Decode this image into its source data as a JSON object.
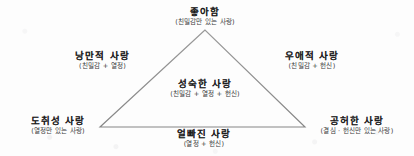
{
  "diagram": {
    "kind": "triangle-diagram",
    "background_color": "#fdfdfd",
    "line_color": "#8d8d8d",
    "text_color": "#1d1d1d",
    "triangle": {
      "apex": {
        "x": 205,
        "y": 30
      },
      "bottom_left": {
        "x": 100,
        "y": 127
      },
      "bottom_right": {
        "x": 305,
        "y": 127
      }
    },
    "nodes": {
      "liking": {
        "title": "좋아함",
        "subtitle": "(친밀감만 있는 사랑)",
        "position": "top-vertex"
      },
      "romantic": {
        "title": "낭만적 사랑",
        "subtitle": "(친밀감 + 열정)",
        "position": "left-edge"
      },
      "companionate": {
        "title": "우애적 사랑",
        "subtitle": "(친밀감 + 헌신)",
        "position": "right-edge"
      },
      "consummate": {
        "title": "성숙한 사랑",
        "subtitle": "(친밀감 + 열정 + 헌신)",
        "position": "center"
      },
      "infatuation": {
        "title": "도취성 사랑",
        "subtitle": "(열정만 있는 사랑)",
        "position": "bottom-left-vertex"
      },
      "empty": {
        "title": "공허한 사랑",
        "subtitle": "(결심 · 헌신만 있는 사랑)",
        "position": "bottom-right-vertex"
      },
      "fatuous": {
        "title": "얼빠진 사랑",
        "subtitle": "(열정 + 헌신)",
        "position": "bottom-edge"
      }
    }
  }
}
